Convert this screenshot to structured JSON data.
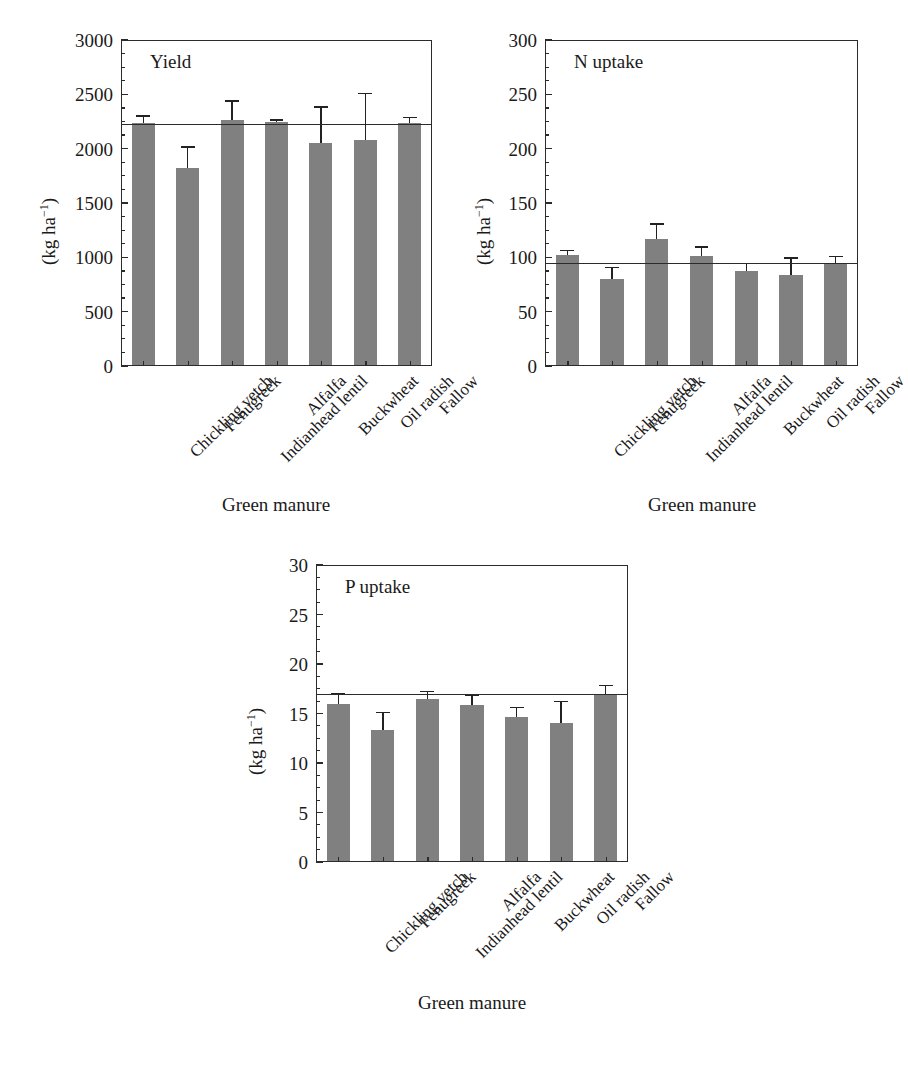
{
  "figure": {
    "background_color": "#ffffff",
    "bar_color": "#808080",
    "axis_color": "#2b2b2b",
    "categories": [
      "Chickling vetch",
      "Fenugreek",
      "Indianhead lentil",
      "Alfalfa",
      "Buckwheat",
      "Oil radish",
      "Fallow"
    ],
    "xlabel": "Green manure",
    "ylabel": "(kg ha",
    "ylabel_exp": "−1",
    "ylabel_close": ")"
  },
  "chart_data": [
    {
      "type": "bar",
      "panel_id": "yield",
      "title": "Yield",
      "xlabel": "Green manure",
      "ylabel": "(kg ha⁻¹)",
      "categories": [
        "Chickling vetch",
        "Fenugreek",
        "Indianhead lentil",
        "Alfalfa",
        "Buckwheat",
        "Oil radish",
        "Fallow"
      ],
      "values": [
        2235,
        1825,
        2265,
        2245,
        2055,
        2080,
        2235
      ],
      "errors": [
        75,
        200,
        180,
        25,
        335,
        435,
        60
      ],
      "reference_line": 2220,
      "ylim": [
        0,
        3000
      ],
      "yticks": [
        0,
        500,
        1000,
        1500,
        2000,
        2500,
        3000
      ],
      "ytick_labels": [
        "0",
        "500",
        "1000",
        "1500",
        "2000",
        "2500",
        "3000"
      ],
      "minor_tick_step": 125,
      "grid": false,
      "legend": "none"
    },
    {
      "type": "bar",
      "panel_id": "n-uptake",
      "title": "N uptake",
      "xlabel": "Green manure",
      "ylabel": "(kg ha⁻¹)",
      "categories": [
        "Chickling vetch",
        "Fenugreek",
        "Indianhead lentil",
        "Alfalfa",
        "Buckwheat",
        "Oil radish",
        "Fallow"
      ],
      "values": [
        102,
        80.5,
        117,
        101,
        87,
        84,
        94.5
      ],
      "errors": [
        5,
        11,
        14.5,
        9.5,
        8,
        16,
        7
      ],
      "reference_line": 94.5,
      "ylim": [
        0,
        300
      ],
      "yticks": [
        0,
        50,
        100,
        150,
        200,
        250,
        300
      ],
      "ytick_labels": [
        "0",
        "50",
        "100",
        "150",
        "200",
        "250",
        "300"
      ],
      "minor_tick_step": 12.5,
      "grid": false,
      "legend": "none"
    },
    {
      "type": "bar",
      "panel_id": "p-uptake",
      "title": "P uptake",
      "xlabel": "Green manure",
      "ylabel": "(kg ha⁻¹)",
      "categories": [
        "Chickling vetch",
        "Fenugreek",
        "Indianhead lentil",
        "Alfalfa",
        "Buckwheat",
        "Oil radish",
        "Fallow"
      ],
      "values": [
        16.0,
        13.3,
        16.5,
        15.9,
        14.6,
        14.0,
        16.9
      ],
      "errors": [
        1.1,
        1.9,
        0.8,
        1.0,
        1.1,
        2.3,
        1.0
      ],
      "reference_line": 16.9,
      "ylim": [
        0,
        30
      ],
      "yticks": [
        0,
        5,
        10,
        15,
        20,
        25,
        30
      ],
      "ytick_labels": [
        "0",
        "5",
        "10",
        "15",
        "20",
        "25",
        "30"
      ],
      "minor_tick_step": 1.25,
      "grid": false,
      "legend": "none"
    }
  ],
  "panels": {
    "yield": {
      "title": "Yield",
      "xlabel": "Green manure",
      "ytick_labels": [
        "3000",
        "2500",
        "2000",
        "1500",
        "1000",
        "500",
        "0"
      ]
    },
    "n_uptake": {
      "title": "N uptake",
      "xlabel": "Green manure",
      "ytick_labels": [
        "300",
        "250",
        "200",
        "150",
        "100",
        "50",
        "0"
      ]
    },
    "p_uptake": {
      "title": "P uptake",
      "xlabel": "Green manure",
      "ytick_labels": [
        "30",
        "25",
        "20",
        "15",
        "10",
        "5",
        "0"
      ]
    }
  }
}
